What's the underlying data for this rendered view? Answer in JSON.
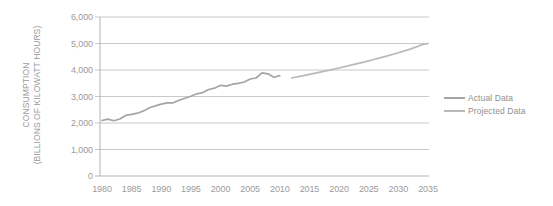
{
  "chart_data": {
    "type": "line",
    "title": "",
    "xlabel": "",
    "ylabel": "CONSUMPTION (BILLIONS OF KILOWATT HOURS)",
    "ylabel_lines": [
      "CONSUMPTION",
      "(BILLIONS OF KILOWATT HOURS)"
    ],
    "xlim": [
      1980,
      2035
    ],
    "ylim": [
      0,
      6000
    ],
    "grid": "horizontal",
    "legend_position": "right-middle",
    "x_ticks": [
      "1980",
      "1985",
      "1990",
      "1995",
      "2000",
      "2005",
      "2010",
      "2015",
      "2020",
      "2025",
      "2030",
      "2035"
    ],
    "y_ticks": [
      {
        "value": 6000,
        "label": "6,000"
      },
      {
        "value": 5000,
        "label": "5,000"
      },
      {
        "value": 4000,
        "label": "4,000"
      },
      {
        "value": 3000,
        "label": "3,000"
      },
      {
        "value": 2000,
        "label": "2,000"
      },
      {
        "value": 1000,
        "label": "1,000"
      },
      {
        "value": 0,
        "label": "0"
      }
    ],
    "series": [
      {
        "name": "Actual Data",
        "color": "#a5a5a5",
        "x": [
          1980,
          1981,
          1982,
          1983,
          1984,
          1985,
          1986,
          1987,
          1988,
          1989,
          1990,
          1991,
          1992,
          1993,
          1994,
          1995,
          1996,
          1997,
          1998,
          1999,
          2000,
          2001,
          2002,
          2003,
          2004,
          2005,
          2006,
          2007,
          2008,
          2009,
          2010
        ],
        "values": [
          2094,
          2147,
          2086,
          2151,
          2285,
          2324,
          2369,
          2457,
          2578,
          2647,
          2713,
          2762,
          2763,
          2861,
          2935,
          3013,
          3101,
          3146,
          3264,
          3312,
          3421,
          3394,
          3465,
          3494,
          3548,
          3661,
          3700,
          3890,
          3855,
          3724,
          3790
        ]
      },
      {
        "name": "Projected Data",
        "color": "#b8b8b8",
        "x": [
          2012,
          2014,
          2016,
          2018,
          2020,
          2022,
          2024,
          2026,
          2028,
          2030,
          2032,
          2034,
          2035
        ],
        "values": [
          3700,
          3790,
          3880,
          3975,
          4075,
          4180,
          4290,
          4405,
          4525,
          4650,
          4790,
          4955,
          5000
        ]
      }
    ],
    "colors": {
      "gridline": "#c9c9c9",
      "axis": "#b3b3b3",
      "tick_text": "#9b9b9b",
      "legend_text": "#8f8f8f"
    }
  }
}
